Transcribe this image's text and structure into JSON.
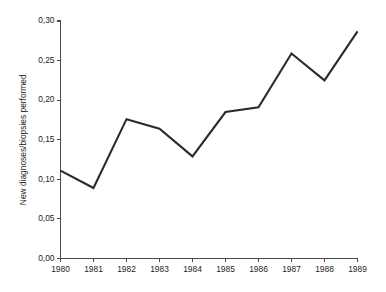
{
  "chart_data": {
    "type": "line",
    "title": "",
    "xlabel": "",
    "ylabel": "New diagnoses/biopsies performed",
    "categories": [
      "1980",
      "1981",
      "1982",
      "1983",
      "1984",
      "1985",
      "1986",
      "1987",
      "1988",
      "1989"
    ],
    "values": [
      0.111,
      0.089,
      0.176,
      0.164,
      0.129,
      0.185,
      0.191,
      0.259,
      0.225,
      0.287
    ],
    "series": [
      {
        "name": "New diagnoses/biopsies performed",
        "values": [
          0.111,
          0.089,
          0.176,
          0.164,
          0.129,
          0.185,
          0.191,
          0.259,
          0.225,
          0.287
        ]
      }
    ],
    "ylim": [
      0.0,
      0.3
    ],
    "xlim": [
      "1980",
      "1989"
    ],
    "ytick_values": [
      0.0,
      0.05,
      0.1,
      0.15,
      0.2,
      0.25,
      0.3
    ],
    "ytick_labels": [
      "0,00",
      "0,05",
      "0,10",
      "0,15",
      "0,20",
      "0,25",
      "0,30"
    ],
    "xtick_labels": [
      "1980",
      "1981",
      "1982",
      "1983",
      "1984",
      "1985",
      "1986",
      "1987",
      "1988",
      "1989"
    ],
    "grid": false,
    "legend": false,
    "legend_position": "none",
    "decimal_separator": ",",
    "line_color": "#2b2b2b",
    "axis_color": "#4a4a4a",
    "background_color": "#ffffff",
    "markers": false
  }
}
